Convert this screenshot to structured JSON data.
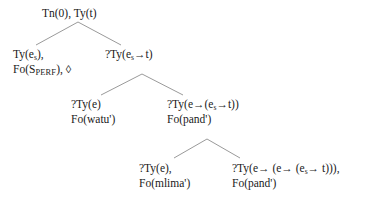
{
  "figure": {
    "kind": "dynamic-syntax-parse-tree",
    "background_color": "#ffffff",
    "text_color": "#1a1a1a",
    "line_color": "#9a9a9a"
  },
  "nodes": {
    "root": {
      "id": "root",
      "line1_a": "Tn(0), Ty(t)",
      "line1_full": "Tn(0), Ty(t)"
    },
    "subject": {
      "id": "subject",
      "line1_a": "Ty(e",
      "line1_sub": "s",
      "line1_b": "),",
      "line2_a": "Fo(S",
      "line2_sc": "PERF",
      "line2_b": "), ",
      "line2_diamond": "◊",
      "line1_full": "Ty(e_s),",
      "line2_full": "Fo(S_PERF), ◊"
    },
    "predicate": {
      "id": "predicate",
      "line1_a": "?Ty(e",
      "line1_sub": "s",
      "line1_arrow": "→",
      "line1_b": "t)",
      "line1_full": "?Ty(e_s→t)"
    },
    "object": {
      "id": "object",
      "line1_a": "?Ty(e)",
      "line2_a": "Fo(watu')",
      "line1_full": "?Ty(e)",
      "line2_full": "Fo(watu')"
    },
    "verbphrase": {
      "id": "verbphrase",
      "line1_a": "?Ty(e",
      "line1_arrow1": "→",
      "line1_b": "(e",
      "line1_sub": "s",
      "line1_arrow2": "→",
      "line1_c": "t))",
      "line2_a": "Fo(pand')",
      "line1_full": "?Ty(e→(e_s→t))",
      "line2_full": "Fo(pand')"
    },
    "object2": {
      "id": "object2",
      "line1_a": "?Ty(e),",
      "line2_a": "Fo(mlima')",
      "line1_full": "?Ty(e),",
      "line2_full": "Fo(mlima')"
    },
    "verb2": {
      "id": "verb2",
      "line1_a": "?Ty(e",
      "line1_arrow1": "→",
      "line1_b": " (e",
      "line1_arrow2": "→",
      "line1_c": " (e",
      "line1_sub": "s",
      "line1_arrow3": "→",
      "line1_d": " t))),",
      "line2_a": "Fo(pand')",
      "line1_full": "?Ty(e→ (e→ (e_s→ t))),",
      "line2_full": "Fo(pand')"
    }
  },
  "branches": [
    {
      "name": "root-to-subject",
      "x1": 78,
      "y1": 22,
      "x2": 36,
      "y2": 45
    },
    {
      "name": "root-to-predicate",
      "x1": 78,
      "y1": 22,
      "x2": 121,
      "y2": 45
    },
    {
      "name": "predicate-to-object",
      "x1": 142,
      "y1": 74,
      "x2": 101,
      "y2": 95
    },
    {
      "name": "predicate-to-verbphr",
      "x1": 142,
      "y1": 74,
      "x2": 183,
      "y2": 95
    },
    {
      "name": "verbphr-to-object2",
      "x1": 207,
      "y1": 139,
      "x2": 174,
      "y2": 158
    },
    {
      "name": "verbphr-to-verb2",
      "x1": 207,
      "y1": 139,
      "x2": 240,
      "y2": 158
    }
  ]
}
